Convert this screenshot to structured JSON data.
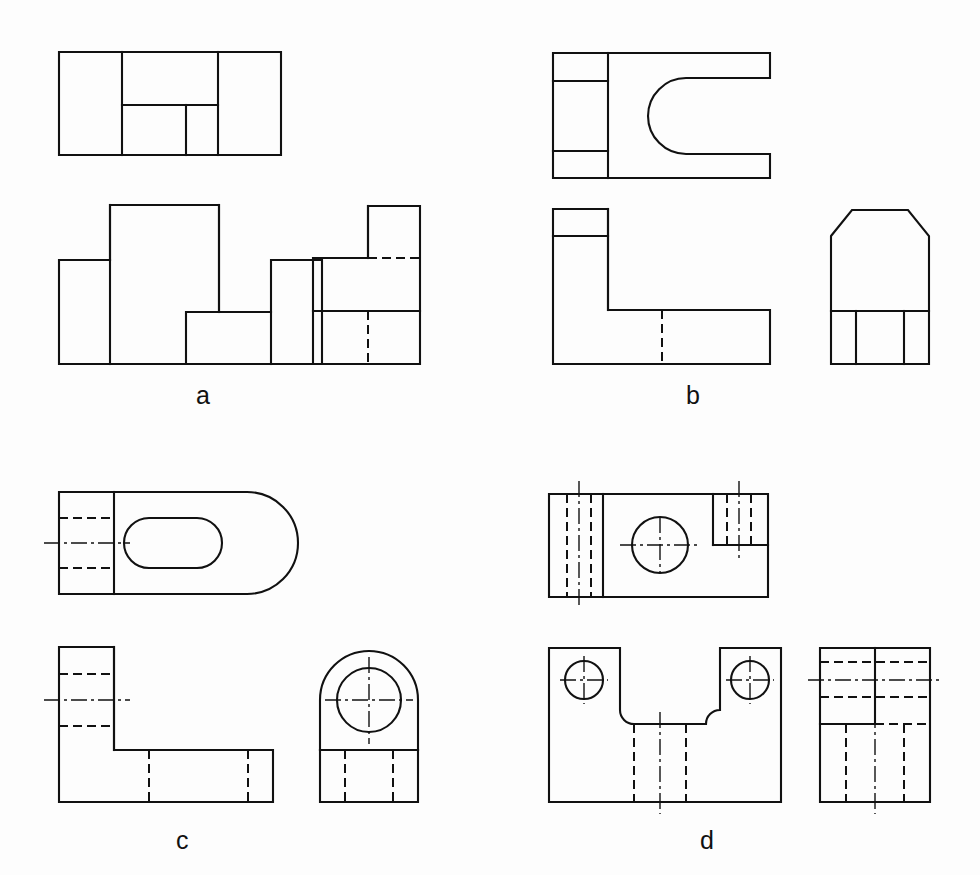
{
  "page": {
    "width": 980,
    "height": 875,
    "background_color": "#fdfdfd",
    "line_color": "#111111"
  },
  "figures": [
    {
      "id": "a",
      "label": "a",
      "label_position": {
        "x": 196,
        "y": 383
      },
      "views": [
        "top-view",
        "front-view",
        "side-view"
      ],
      "object": "Stepped block with a central rectangular notch",
      "features": [
        "rectangular notch",
        "stepped profile",
        "hidden edge in side view"
      ]
    },
    {
      "id": "b",
      "label": "b",
      "label_position": {
        "x": 686,
        "y": 383
      },
      "views": [
        "top-view",
        "front-view",
        "side-view"
      ],
      "object": "L-shaped bracket with U-shaped slot and chamfered top",
      "features": [
        "U-shaped slot",
        "chamfer",
        "rib",
        "hidden edge"
      ]
    },
    {
      "id": "c",
      "label": "c",
      "label_position": {
        "x": 176,
        "y": 828
      },
      "views": [
        "top-view",
        "front-view",
        "side-view"
      ],
      "object": "L-shaped bracket with rounded end and through hole",
      "features": [
        "obround slot",
        "round end",
        "through hole",
        "centre lines",
        "hidden edges"
      ]
    },
    {
      "id": "d",
      "label": "d",
      "label_position": {
        "x": 700,
        "y": 828
      },
      "views": [
        "top-view",
        "front-view",
        "side-view"
      ],
      "object": "Saddle block with central through hole and two mounting holes",
      "features": [
        "central through hole",
        "two mounting holes",
        "filleted pocket",
        "centre lines",
        "hidden edges"
      ]
    }
  ],
  "line_styles": {
    "visible_edge": "continuous thick",
    "hidden_edge": "dashed",
    "centre_line": "chain dash-dot"
  }
}
